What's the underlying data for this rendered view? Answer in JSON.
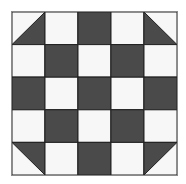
{
  "colors": {
    "dark": "#4a4a4a",
    "light": "#f7f7f7",
    "line": "#222222"
  },
  "grid": {
    "rows": 5,
    "cols": 5,
    "cells": [
      [
        "tri-dark-br",
        "light",
        "dark",
        "light",
        "tri-dark-bl"
      ],
      [
        "light",
        "dark",
        "light",
        "dark",
        "light"
      ],
      [
        "dark",
        "light",
        "dark",
        "light",
        "dark"
      ],
      [
        "light",
        "dark",
        "light",
        "dark",
        "light"
      ],
      [
        "tri-dark-tr",
        "light",
        "dark",
        "light",
        "tri-dark-tl"
      ]
    ]
  }
}
